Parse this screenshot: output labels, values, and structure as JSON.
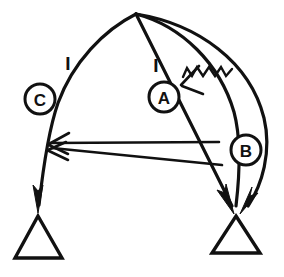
{
  "figure": {
    "background_color": "#ffffff",
    "stroke_color": "#111111",
    "width": 284,
    "height": 277
  },
  "nodes": [
    {
      "id": "node-c",
      "label": "C",
      "cx": 40,
      "cy": 99,
      "r": 15
    },
    {
      "id": "node-a",
      "label": "A",
      "cx": 164,
      "cy": 97,
      "r": 15
    },
    {
      "id": "node-b",
      "label": "B",
      "cx": 246,
      "cy": 150,
      "r": 15
    }
  ],
  "tick_labels": [
    {
      "id": "tick-left",
      "label": "I",
      "x": 68,
      "y": 63
    },
    {
      "id": "tick-right",
      "label": "I",
      "x": 156,
      "y": 65
    }
  ],
  "supports": [
    {
      "id": "support-left",
      "apex_x": 38,
      "apex_y": 216,
      "base_y": 258,
      "base_left_x": 15,
      "base_right_x": 62
    },
    {
      "id": "support-right",
      "apex_x": 236,
      "apex_y": 216,
      "base_y": 253,
      "base_left_x": 212,
      "base_right_x": 260
    }
  ],
  "apex": {
    "x": 136,
    "y": 14
  },
  "arrows": [
    {
      "id": "arrow-left-down",
      "head_x": 38,
      "head_y": 212,
      "direction": "down",
      "style": "solid"
    },
    {
      "id": "arrow-right-inner-down",
      "head_x": 231,
      "head_y": 212,
      "direction": "down-right",
      "style": "solid"
    },
    {
      "id": "arrow-right-outer-down",
      "head_x": 245,
      "head_y": 212,
      "direction": "down-left",
      "style": "solid"
    },
    {
      "id": "arrow-horizontal-upper",
      "head_x": 49,
      "head_y": 143,
      "tail_x": 219,
      "tail_y": 142,
      "direction": "left",
      "style": "open"
    },
    {
      "id": "arrow-horizontal-lower",
      "head_x": 49,
      "head_y": 147,
      "tail_x": 221,
      "tail_y": 164,
      "direction": "left",
      "style": "open"
    },
    {
      "id": "arrow-zigzag",
      "head_x": 182,
      "head_y": 86,
      "tail_x": 232,
      "tail_y": 70,
      "direction": "left",
      "style": "open-zigzag"
    }
  ]
}
